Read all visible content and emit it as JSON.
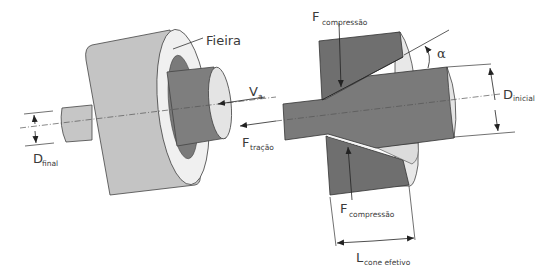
{
  "diagram": {
    "colors": {
      "die_light": "#c4c4c4",
      "die_face": "#f0f0f0",
      "die_dark": "#6f6f6f",
      "wire": "#8a8a8a",
      "wire_dark": "#666666",
      "line": "#333333",
      "background": "#ffffff"
    },
    "left_view": {
      "label_die": "Fieira",
      "label_velocity_main": "V",
      "label_velocity_sub": "a",
      "label_force_main": "F",
      "label_force_sub": "tração",
      "label_dfinal_main": "D",
      "label_dfinal_sub": "final"
    },
    "right_view": {
      "label_fcomp_top_main": "F",
      "label_fcomp_top_sub": "compressão",
      "label_fcomp_bottom_main": "F",
      "label_fcomp_bottom_sub": "compressão",
      "label_alpha": "α",
      "label_dinicial_main": "D",
      "label_dinicial_sub": "inicial",
      "label_lcone_main": "L",
      "label_lcone_sub": "cone efetivo"
    }
  }
}
